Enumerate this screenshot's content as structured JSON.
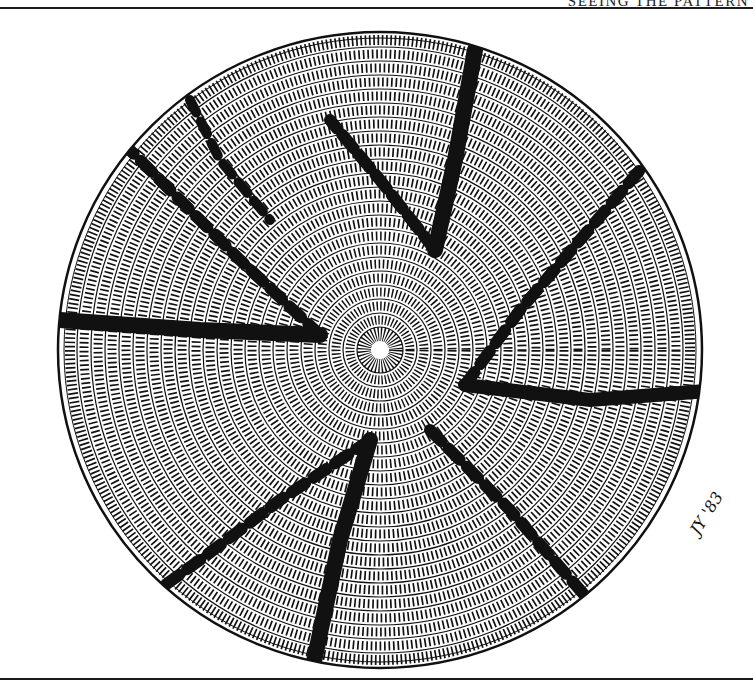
{
  "page": {
    "running_header": "SEEING THE PATTERN"
  },
  "illustration": {
    "subject": "coiled basket viewed from above with radial pinwheel design",
    "signature": "JY '83",
    "colors": {
      "ink": "#111111",
      "paper": "#ffffff"
    },
    "rays": 8
  }
}
